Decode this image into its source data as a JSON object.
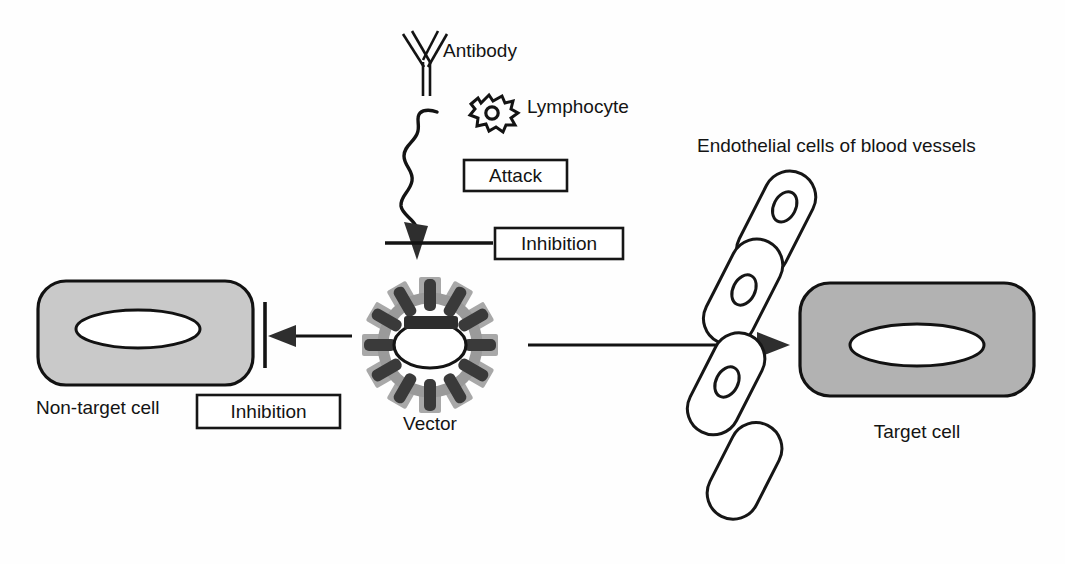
{
  "figure": {
    "background_color": "#fefefe"
  },
  "labels": {
    "antibody": "Antibody",
    "lymphocyte": "Lymphocyte",
    "vector": "Vector",
    "non_target_cell": "Non-target cell",
    "target_cell": "Target cell",
    "endothelium": "Endothelial cells of blood vessels"
  },
  "boxes": {
    "attack": "Attack",
    "inhibition_top": "Inhibition",
    "inhibition_left": "Inhibition"
  },
  "colors": {
    "ink": "#131313",
    "non_target_fill": "#c9c9c9",
    "target_fill": "#b2b2b2",
    "vector_ring": "#9a9a9a",
    "vector_tab": "#a8a8a8",
    "vector_spoke": "#3a3a3a",
    "nucleus_fill": "#ffffff",
    "endothelial_fill": "#ffffff"
  },
  "elements": {
    "antibody_icon": "antibody-y-shape-icon",
    "lymphocyte_icon": "lymphocyte-cell-icon",
    "vector_icon": "vector-particle-icon",
    "wavy_arrow": "wavy-attack-arrow",
    "inhibition_bar_top": "inhibition-bar-horizontal",
    "inhibition_bar_left": "inhibition-bar-vertical",
    "arrow_to_non_target": "arrow-to-non-target-cell",
    "arrow_to_target": "arrow-to-target-cell"
  },
  "geometry": {
    "vector_center_x": 430,
    "vector_center_y": 345,
    "vector_outer_radius": 68,
    "spoke_count": 12,
    "endothelial_cell_count": 4,
    "endothelial_angle_deg": 27
  }
}
